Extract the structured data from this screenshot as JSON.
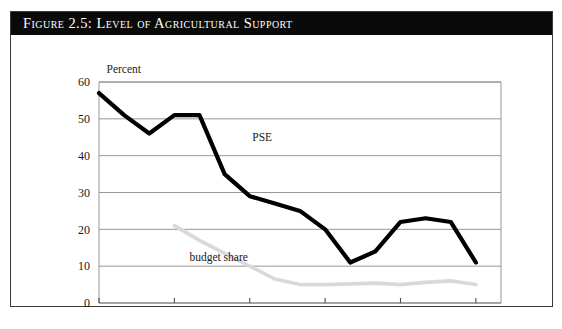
{
  "figure": {
    "title": "Figure 2.5:  Level of Agricultural Support",
    "source_note": ""
  },
  "chart_data": {
    "type": "line",
    "title": "Figure 2.5:  Level of Agricultural Support",
    "xlabel": "",
    "ylabel": "Percent",
    "ylim": [
      0,
      60
    ],
    "ytick_labels": [
      "0",
      "10",
      "20",
      "30",
      "40",
      "50",
      "60"
    ],
    "ytick_values": [
      0,
      10,
      20,
      30,
      40,
      50,
      60
    ],
    "xlim": [
      1986,
      2002
    ],
    "xtick_labels": [
      "1986",
      "1989",
      "1992",
      "1995",
      "1998",
      "2001"
    ],
    "xtick_values": [
      1986,
      1989,
      1992,
      1995,
      1998,
      2001
    ],
    "grid": "horizontal",
    "legend": "inline-annotations",
    "x": [
      1986,
      1987,
      1988,
      1989,
      1990,
      1991,
      1992,
      1993,
      1994,
      1995,
      1996,
      1997,
      1998,
      1999,
      2000,
      2001
    ],
    "series": [
      {
        "name": "PSE",
        "color": "#000000",
        "linewidth": 4.2,
        "label_x": 1992.1,
        "label_y": 44,
        "values": [
          57,
          51,
          46,
          51,
          51,
          35,
          29,
          27,
          25,
          20,
          11,
          14,
          22,
          23,
          22,
          11
        ]
      },
      {
        "name": "budget share",
        "color": "#d9d9d9",
        "linewidth": 3.6,
        "label_x": 1989.6,
        "label_y": 11.5,
        "x": [
          1989,
          1990,
          1991,
          1992,
          1993,
          1994,
          1995,
          1996,
          1997,
          1998,
          1999,
          2000,
          2001
        ],
        "values": [
          21,
          17,
          13.5,
          10,
          6.5,
          5,
          5,
          5.2,
          5.4,
          5,
          5.6,
          6,
          5
        ]
      }
    ],
    "annotations": [
      {
        "text": "Percent",
        "x": 1986.3,
        "y": 62.5
      }
    ]
  }
}
